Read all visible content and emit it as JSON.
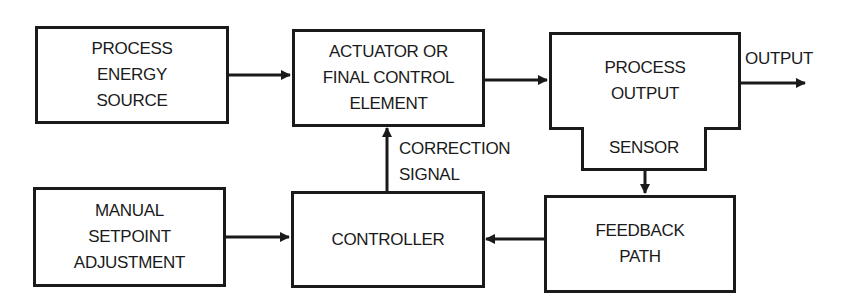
{
  "diagram": {
    "type": "block-diagram",
    "title": "",
    "blocks": [
      {
        "id": "energy",
        "label": "PROCESS\nENERGY\nSOURCE"
      },
      {
        "id": "actuator",
        "label": "ACTUATOR OR\nFINAL CONTROL\nELEMENT"
      },
      {
        "id": "process",
        "label": "PROCESS\nOUTPUT"
      },
      {
        "id": "sensor",
        "label": "SENSOR"
      },
      {
        "id": "manual",
        "label": "MANUAL\nSETPOINT\nADJUSTMENT"
      },
      {
        "id": "controller",
        "label": "CONTROLLER"
      },
      {
        "id": "feedback",
        "label": "FEEDBACK\nPATH"
      }
    ],
    "edges": [
      {
        "from": "energy",
        "to": "actuator"
      },
      {
        "from": "actuator",
        "to": "process"
      },
      {
        "from": "process",
        "to": "output"
      },
      {
        "from": "sensor",
        "to": "feedback"
      },
      {
        "from": "feedback",
        "to": "controller"
      },
      {
        "from": "manual",
        "to": "controller"
      },
      {
        "from": "controller",
        "to": "actuator",
        "label": "CORRECTION\nSIGNAL"
      }
    ],
    "labels": {
      "output": "OUTPUT",
      "correction": "CORRECTION\nSIGNAL"
    },
    "colors": {
      "line": "#1a1a1a",
      "background": "#ffffff"
    }
  }
}
